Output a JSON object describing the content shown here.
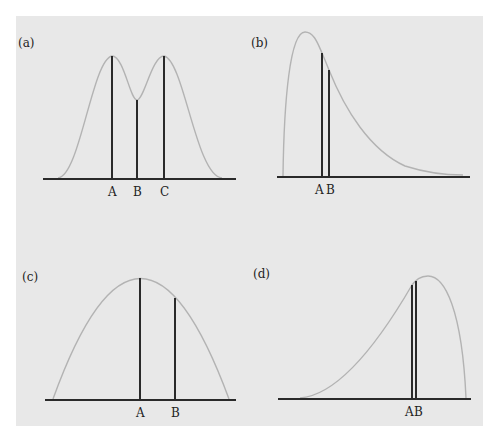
{
  "colors": {
    "background": "#e8e8e8",
    "curve": "#b3b3b3",
    "line": "#2a2a2a"
  },
  "panels": [
    {
      "id": "a",
      "label": "(a)",
      "description": "Bimodal symmetric distribution",
      "points": [
        {
          "name": "A",
          "label": "A"
        },
        {
          "name": "B",
          "label": "B"
        },
        {
          "name": "C",
          "label": "C"
        }
      ]
    },
    {
      "id": "b",
      "label": "(b)",
      "description": "Right-skewed distribution",
      "points": [
        {
          "name": "A",
          "label": "A"
        },
        {
          "name": "B",
          "label": "B"
        }
      ]
    },
    {
      "id": "c",
      "label": "(c)",
      "description": "Symmetric unimodal (parabolic) distribution",
      "points": [
        {
          "name": "A",
          "label": "A"
        },
        {
          "name": "B",
          "label": "B"
        }
      ]
    },
    {
      "id": "d",
      "label": "(d)",
      "description": "Left-skewed distribution",
      "points": [
        {
          "name": "A",
          "label": "A"
        },
        {
          "name": "B",
          "label": "B"
        }
      ]
    }
  ]
}
